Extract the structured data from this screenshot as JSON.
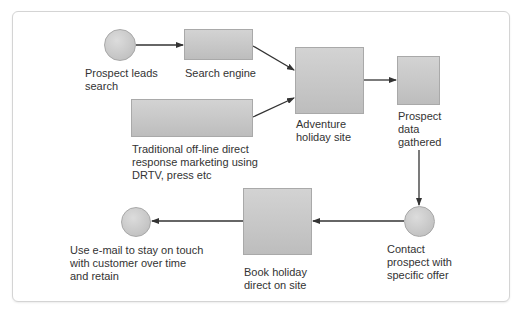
{
  "nodes": {
    "prospect_leads": {
      "shape": "circle",
      "label": "Prospect leads\nsearch"
    },
    "search_engine": {
      "shape": "rectangle",
      "label": "Search engine"
    },
    "traditional": {
      "shape": "rectangle",
      "label": "Traditional off-line direct\nresponse marketing using\nDRTV, press etc"
    },
    "adventure_site": {
      "shape": "rectangle",
      "label": "Adventure\nholiday site"
    },
    "prospect_data": {
      "shape": "rectangle",
      "label": "Prospect\ndata\ngathered"
    },
    "contact_prospect": {
      "shape": "circle",
      "label": "Contact\nprospect with\nspecific offer"
    },
    "book_holiday": {
      "shape": "rectangle",
      "label": "Book holiday\ndirect on site"
    },
    "use_email": {
      "shape": "circle",
      "label": "Use e-mail to stay on touch\nwith customer over time\nand retain"
    }
  },
  "edges": [
    {
      "from": "prospect_leads",
      "to": "search_engine"
    },
    {
      "from": "search_engine",
      "to": "adventure_site"
    },
    {
      "from": "traditional",
      "to": "adventure_site"
    },
    {
      "from": "adventure_site",
      "to": "prospect_data"
    },
    {
      "from": "prospect_data",
      "to": "contact_prospect"
    },
    {
      "from": "contact_prospect",
      "to": "book_holiday"
    },
    {
      "from": "book_holiday",
      "to": "use_email"
    }
  ],
  "colors": {
    "shape_fill": "#c8c8c8",
    "line": "#333333",
    "text": "#333333",
    "border": "#d4d4d4"
  }
}
